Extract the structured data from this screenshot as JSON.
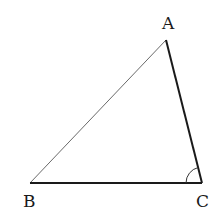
{
  "diagram": {
    "type": "triangle",
    "vertices": [
      {
        "label": "A",
        "x": 166,
        "y": 40,
        "label_x": 162,
        "label_y": 29
      },
      {
        "label": "B",
        "x": 30,
        "y": 183,
        "label_x": 23,
        "label_y": 207
      },
      {
        "label": "C",
        "x": 202,
        "y": 183,
        "label_x": 196,
        "label_y": 207
      }
    ],
    "edges": [
      {
        "from": "A",
        "to": "B",
        "style": "thin",
        "color": "#6a6a6a"
      },
      {
        "from": "A",
        "to": "C",
        "style": "thick",
        "color": "#1a1a1a"
      },
      {
        "from": "B",
        "to": "C",
        "style": "thick",
        "color": "#1a1a1a"
      }
    ],
    "angle_marks": [
      {
        "at": "C",
        "radius": 16
      }
    ]
  }
}
